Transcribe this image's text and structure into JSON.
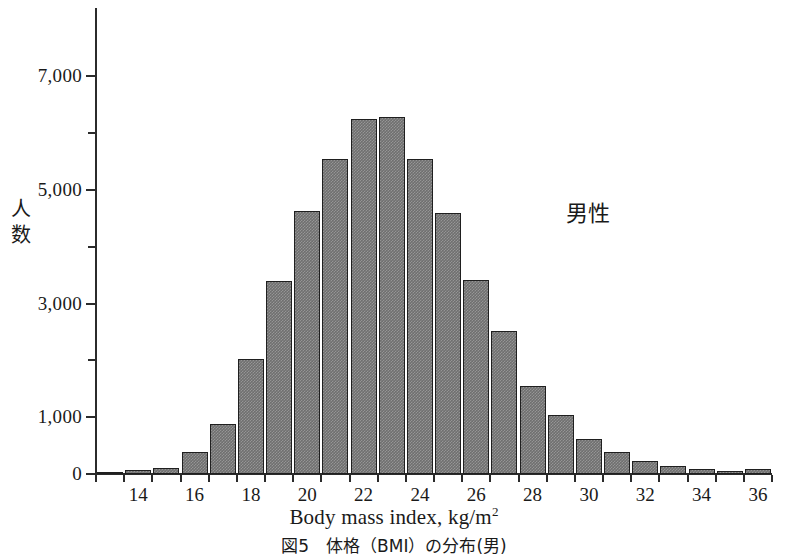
{
  "figure": {
    "caption": "図5　体格（BMI）の分布(男)"
  },
  "annotation": {
    "label": "男性"
  },
  "axes": {
    "y_title": "人数",
    "x_title_main": "Body mass index, kg/m",
    "x_title_sup": "2"
  },
  "chart_data": {
    "type": "bar",
    "title": "図5　体格（BMI）の分布(男)",
    "xlabel": "Body mass index, kg/m2",
    "ylabel": "人数",
    "annotations": [
      "男性"
    ],
    "grid": false,
    "legend": null,
    "xlim": [
      12.5,
      36.5
    ],
    "ylim": [
      0,
      8200
    ],
    "y_major_ticks": [
      0,
      1000,
      3000,
      5000,
      7000
    ],
    "y_major_tick_labels": [
      "0",
      "1,000",
      "3,000",
      "5,000",
      "7,000"
    ],
    "y_minor_ticks": [
      2000,
      4000,
      6000
    ],
    "x_tick_labels": [
      "14",
      "16",
      "18",
      "20",
      "22",
      "24",
      "26",
      "28",
      "30",
      "32",
      "34",
      "36"
    ],
    "x_tick_values": [
      14,
      16,
      18,
      20,
      22,
      24,
      26,
      28,
      30,
      32,
      34,
      36
    ],
    "bin_width": 1,
    "bar_color": "#6f6f6f",
    "bar_edge_color": "#1f1f1f",
    "categories": [
      13,
      14,
      15,
      16,
      17,
      18,
      19,
      20,
      21,
      22,
      23,
      24,
      25,
      26,
      27,
      28,
      29,
      30,
      31,
      32,
      33,
      34,
      35,
      36
    ],
    "values": [
      30,
      70,
      110,
      390,
      880,
      2020,
      3400,
      4620,
      5550,
      6240,
      6290,
      5540,
      4600,
      3420,
      2520,
      1540,
      1030,
      620,
      380,
      230,
      140,
      90,
      60,
      80
    ]
  }
}
